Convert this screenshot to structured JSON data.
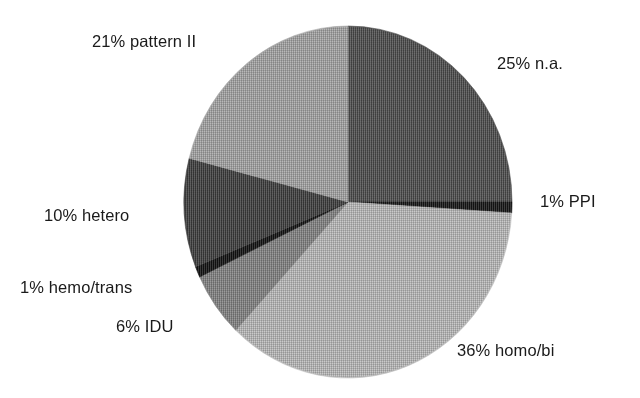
{
  "chart_data": {
    "type": "pie",
    "title": "",
    "subtitle": "",
    "xlabel": "",
    "ylabel": "",
    "legend_position": "none",
    "grid": false,
    "label_format": "{value}% {category}",
    "units": "percent",
    "total": 100,
    "start_angle_deg": 0,
    "direction": "clockwise",
    "categories": [
      "n.a.",
      "PPI",
      "homo/bi",
      "IDU",
      "hemo/trans",
      "hetero",
      "pattern II"
    ],
    "values": [
      25,
      1,
      36,
      6,
      1,
      10,
      21
    ],
    "slices": [
      {
        "category": "n.a.",
        "value": 25,
        "label": "25% n.a.",
        "color": "#4f4f4f",
        "start_deg": 0,
        "end_deg": 90
      },
      {
        "category": "PPI",
        "value": 1,
        "label": "1% PPI",
        "color": "#161616",
        "start_deg": 90,
        "end_deg": 93.6
      },
      {
        "category": "homo/bi",
        "value": 36,
        "label": "36% homo/bi",
        "color": "#bfbfbf",
        "start_deg": 93.6,
        "end_deg": 223.2
      },
      {
        "category": "IDU",
        "value": 6,
        "label": "6% IDU",
        "color": "#868686",
        "start_deg": 223.2,
        "end_deg": 244.8
      },
      {
        "category": "hemo/trans",
        "value": 1,
        "label": "1% hemo/trans",
        "color": "#121212",
        "start_deg": 244.8,
        "end_deg": 248.4
      },
      {
        "category": "hetero",
        "value": 10,
        "label": "10% hetero",
        "color": "#3f3f3f",
        "start_deg": 248.4,
        "end_deg": 284.4
      },
      {
        "category": "pattern II",
        "value": 21,
        "label": "21% pattern II",
        "color": "#a9a9a9",
        "start_deg": 284.4,
        "end_deg": 360
      }
    ]
  },
  "labels": {
    "pattern2": "21% pattern II",
    "na": "25% n.a.",
    "ppi": "1% PPI",
    "hetero": "10% hetero",
    "hemo_trans": "1% hemo/trans",
    "idu": "6% IDU",
    "homo_bi": "36% homo/bi"
  },
  "colors": {
    "background": "#ffffff",
    "text": "#1a1a1a",
    "na": "#4f4f4f",
    "ppi": "#161616",
    "homo_bi": "#bfbfbf",
    "idu": "#868686",
    "hemo_trans": "#121212",
    "hetero": "#3f3f3f",
    "pattern2": "#a9a9a9"
  }
}
